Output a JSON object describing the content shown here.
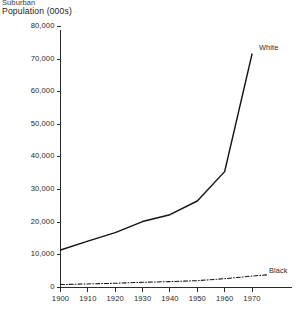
{
  "header": {
    "title_top": "Suburban",
    "title_main": "Population (000s)"
  },
  "series_labels": {
    "white": "White",
    "black": "Black"
  },
  "chart_data": {
    "type": "line",
    "title": "Suburban Population (000s)",
    "xlabel": "",
    "ylabel": "Population (000s)",
    "x": [
      1900,
      1910,
      1920,
      1930,
      1940,
      1950,
      1960,
      1970
    ],
    "xlim": [
      1900,
      1975
    ],
    "ylim": [
      0,
      80000
    ],
    "ytick_labels": [
      "80,000",
      "70,000",
      "60,000",
      "50,000",
      "40,000",
      "30,000",
      "20,000",
      "10,000",
      "0"
    ],
    "yticks": [
      80000,
      70000,
      60000,
      50000,
      40000,
      30000,
      20000,
      10000,
      0
    ],
    "xtick_labels": [
      "1900",
      "1910",
      "1920",
      "1930",
      "1940",
      "1950",
      "1960",
      "1970"
    ],
    "grid": false,
    "legend": "inline-right",
    "series": [
      {
        "name": "White",
        "style": "solid",
        "values": [
          11500,
          14200,
          16800,
          20200,
          22300,
          26500,
          35500,
          71500
        ]
      },
      {
        "name": "Black",
        "style": "dash-dot",
        "values": [
          900,
          1100,
          1300,
          1600,
          1800,
          2100,
          2700,
          3500
        ]
      }
    ]
  }
}
